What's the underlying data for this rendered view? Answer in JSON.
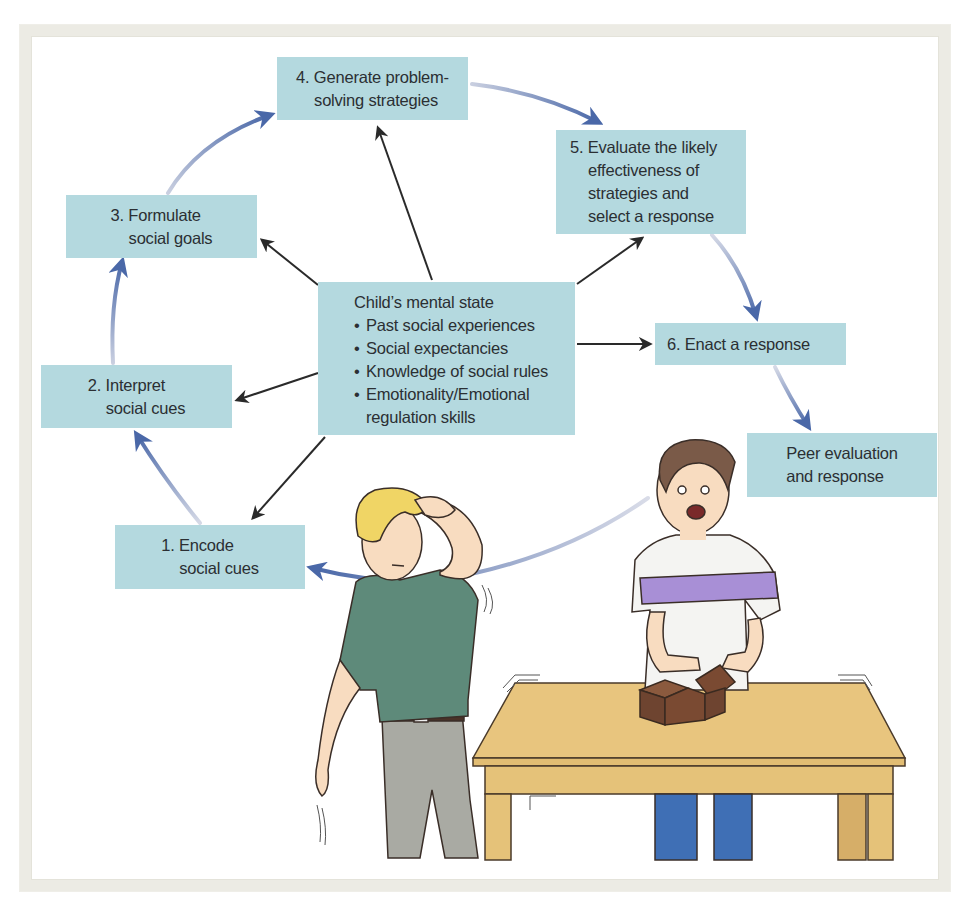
{
  "figure": {
    "type": "social information-processing model diagram with illustration",
    "colors": {
      "box_fill": "#b4d9df",
      "text": "#2b2f33",
      "cycle_arrow": "#4a68a8",
      "influence_arrow": "#2a2a2a",
      "frame": "#ecebe4"
    }
  },
  "steps": [
    {
      "id": "step-1",
      "lines": [
        "1. Encode",
        "social cues"
      ]
    },
    {
      "id": "step-2",
      "lines": [
        "2. Interpret",
        "social cues"
      ]
    },
    {
      "id": "step-3",
      "lines": [
        "3. Formulate",
        "social goals"
      ]
    },
    {
      "id": "step-4",
      "lines": [
        "4. Generate problem-",
        "solving strategies"
      ]
    },
    {
      "id": "step-5",
      "lines": [
        "5. Evaluate the likely",
        "effectiveness of",
        "strategies and",
        "select a response"
      ]
    },
    {
      "id": "step-6",
      "lines": [
        "6. Enact a response"
      ]
    },
    {
      "id": "peer",
      "lines": [
        "Peer evaluation",
        "and response"
      ]
    }
  ],
  "mental_state": {
    "title": "Child’s mental state",
    "bullets": [
      "Past social experiences",
      "Social expectancies",
      "Knowledge of social rules",
      "Emotionality/Emotional"
    ],
    "continuation": "regulation skills"
  },
  "illustration": {
    "description": "Two boys at a table: blond boy in green shirt holding his head walking away; dark-haired boy in white shirt with purple stripe reacting at table with brown blocks",
    "colors": {
      "green_shirt": "#5e8a7a",
      "purple_stripe": "#a88fd6",
      "table": "#e8c57e",
      "blocks": "#7a4a32",
      "jeans": "#3f6fb5",
      "pants_gray": "#a9aaa3",
      "blond_hair": "#f0d565",
      "brown_hair": "#7a5a48",
      "skin": "#f8dcc0"
    }
  }
}
